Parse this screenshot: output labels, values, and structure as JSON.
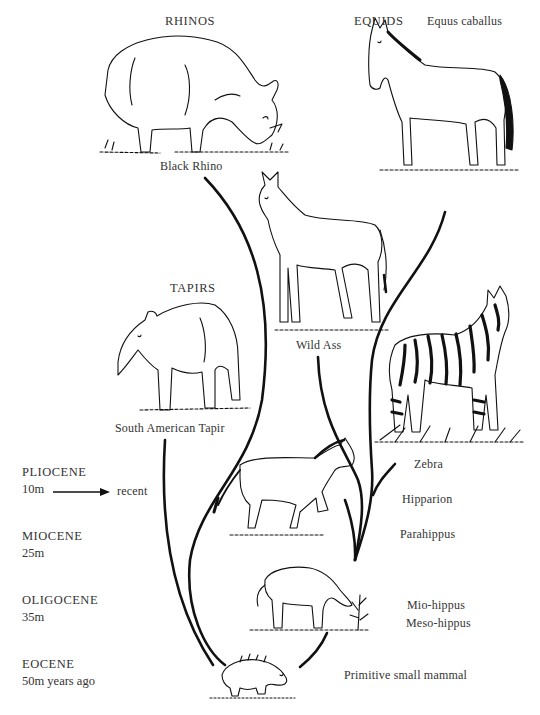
{
  "groups": {
    "rhinos": {
      "title": "RHINOS",
      "species": "Black Rhino"
    },
    "equids": {
      "title": "EQUIDS",
      "species": "Equus caballus"
    },
    "tapirs": {
      "title": "TAPIRS",
      "species": "South American Tapir"
    }
  },
  "species_labels": {
    "wild_ass": "Wild Ass",
    "zebra": "Zebra",
    "hipparion": "Hipparion",
    "parahippus": "Parahippus",
    "mio_hippus": "Mio-hippus",
    "meso_hippus": "Meso-hippus",
    "primitive": "Primitive small mammal"
  },
  "timeline": [
    {
      "epoch": "PLIOCENE",
      "age": "10m",
      "arrow_to": "recent"
    },
    {
      "epoch": "MIOCENE",
      "age": "25m"
    },
    {
      "epoch": "OLIGOCENE",
      "age": "35m"
    },
    {
      "epoch": "EOCENE",
      "age": "50m years ago"
    }
  ],
  "illustrations": [
    "black-rhino",
    "horse-equus-caballus",
    "wild-ass",
    "south-american-tapir",
    "zebra",
    "hipparion",
    "parahippus-mesohippus",
    "primitive-small-mammal"
  ],
  "colors": {
    "ink": "#111111",
    "text": "#333333",
    "background": "#ffffff"
  }
}
